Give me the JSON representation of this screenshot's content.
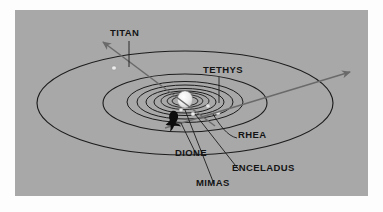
{
  "figure": {
    "kind": "saturn-moon-orbit-diagram",
    "background_color": "#a8a8a8",
    "page_color": "#fdfdfd",
    "line_color": "#1c1c1c",
    "trajectory_color": "#6a6a6a",
    "planet_color": "#e8e8e8",
    "moon_marker_color": "#e6e6e6",
    "spacecraft_color": "#0d0d0d"
  },
  "labels": {
    "titan": "TITAN",
    "tethys": "TETHYS",
    "rhea": "RHEA",
    "dione": "DIONE",
    "enceladus": "ENCELADUS",
    "mimas": "MIMAS"
  },
  "chart_data": {
    "type": "scatter",
    "title": "",
    "xlabel": "",
    "ylabel": "",
    "grid": false,
    "legend": "none",
    "center_body": {
      "name": "Saturn",
      "cx": 170,
      "cy": 90,
      "rx": 8,
      "ry": 9,
      "rings": true
    },
    "orbits": [
      {
        "name": "TITAN",
        "rx": 148,
        "ry": 52,
        "cx": 170,
        "cy": 93
      },
      {
        "name": "RHEA",
        "rx": 82,
        "ry": 29,
        "cx": 170,
        "cy": 93
      },
      {
        "name": "DIONE",
        "rx": 58,
        "ry": 20.5,
        "cx": 170,
        "cy": 92
      },
      {
        "name": "TETHYS",
        "rx": 48,
        "ry": 17,
        "cx": 170,
        "cy": 92
      },
      {
        "name": "ENCELADUS",
        "rx": 39,
        "ry": 13.5,
        "cx": 170,
        "cy": 92
      },
      {
        "name": "MIMAS",
        "rx": 31,
        "ry": 11,
        "cx": 170,
        "cy": 92
      },
      {
        "name": "RING-A",
        "rx": 24,
        "ry": 8.5,
        "cx": 170,
        "cy": 91
      },
      {
        "name": "RING-B",
        "rx": 18,
        "ry": 6.5,
        "cx": 170,
        "cy": 91
      },
      {
        "name": "RING-C",
        "rx": 13,
        "ry": 4.8,
        "cx": 170,
        "cy": 91
      }
    ],
    "moon_markers": [
      {
        "name": "TITAN",
        "x": 99,
        "y": 58
      },
      {
        "name": "TETHYS",
        "x": 193,
        "y": 96
      },
      {
        "name": "RHEA",
        "x": 203,
        "y": 103
      },
      {
        "name": "DIONE",
        "x": 160,
        "y": 108
      },
      {
        "name": "ENCELADUS",
        "x": 178,
        "y": 104
      },
      {
        "name": "MIMAS",
        "x": 166,
        "y": 100
      }
    ],
    "trajectories": [
      {
        "name": "flyby-outbound",
        "from": [
          88,
          32
        ],
        "to": [
          200,
          116
        ],
        "arrow_at": "from"
      },
      {
        "name": "flyby-inbound",
        "from": [
          335,
          62
        ],
        "to": [
          150,
          118
        ],
        "arrow_at": "from"
      }
    ],
    "spacecraft": {
      "name": "spacecraft-silhouette",
      "x": 158,
      "y": 112
    },
    "leader_lines": [
      {
        "label": "TITAN",
        "path": "M 114 31 L 114 57"
      },
      {
        "label": "TETHYS",
        "path": "M 204 67 L 204 93"
      },
      {
        "label": "RHEA",
        "path": "M 222 128 C 212 126 204 114 198 104"
      },
      {
        "label": "DIONE",
        "path": "M 182 146 L 166 113"
      },
      {
        "label": "ENCELADUS",
        "path": "M 224 160 L 180 104"
      },
      {
        "label": "MIMAS",
        "path": "M 199 174 L 170 100"
      }
    ]
  }
}
